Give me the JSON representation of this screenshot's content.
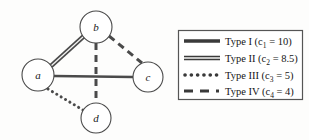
{
  "diagram": {
    "background_color": "#fdfdfc",
    "stroke_color": "#4a4a4a",
    "node_fill": "#ffffff",
    "nodes": [
      {
        "id": "a",
        "label": "a",
        "cx": 38,
        "cy": 75,
        "r": 16
      },
      {
        "id": "b",
        "label": "b",
        "cx": 96,
        "cy": 27,
        "r": 16
      },
      {
        "id": "c",
        "label": "c",
        "cx": 148,
        "cy": 77,
        "r": 15
      },
      {
        "id": "d",
        "label": "d",
        "cx": 96,
        "cy": 118,
        "r": 15
      }
    ],
    "edges": [
      {
        "from": "a",
        "to": "b",
        "type": "Type II"
      },
      {
        "from": "b",
        "to": "c",
        "type": "Type IV"
      },
      {
        "from": "b",
        "to": "d",
        "type": "Type IV"
      },
      {
        "from": "a",
        "to": "c",
        "type": "Type I"
      },
      {
        "from": "a",
        "to": "d",
        "type": "Type III"
      }
    ]
  },
  "legend": {
    "box": {
      "x": 178,
      "y": 30,
      "width": 125,
      "height": 70
    },
    "entries": [
      {
        "key": "type-1",
        "style": "solid-thick",
        "label": "Type I (c",
        "subscript": "1",
        "value": " = 10)"
      },
      {
        "key": "type-2",
        "style": "double",
        "label": "Type II (c",
        "subscript": "2",
        "value": " = 8.5)"
      },
      {
        "key": "type-3",
        "style": "dotted",
        "label": "Type III (c",
        "subscript": "3",
        "value": " = 5)"
      },
      {
        "key": "type-4",
        "style": "dashed",
        "label": "Type IV (c",
        "subscript": "4",
        "value": " = 4)"
      }
    ]
  }
}
